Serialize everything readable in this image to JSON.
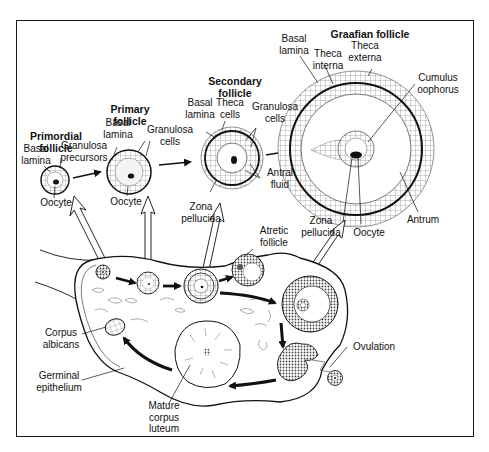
{
  "titles": {
    "primordial": "Primordial\nfollicle",
    "primary": "Primary\nfollicle",
    "secondary": "Secondary\nfollicle",
    "graafian": "Graafian follicle"
  },
  "labels": {
    "primordial_basal_lamina": "Basal\nlamina",
    "granulosa_precursors": "Granulosa\nprecursors",
    "primordial_oocyte": "Oocyte",
    "primary_basal_lamina": "Basal\nlamina",
    "primary_granulosa_cells": "Granulosa\ncells",
    "primary_oocyte": "Oocyte",
    "secondary_basal_lamina": "Basal\nlamina",
    "secondary_theca_cells": "Theca\ncells",
    "secondary_granulosa_cells": "Granulosa\ncells",
    "secondary_antral_fluid": "Antral\nfluid",
    "secondary_zona_pellucida": "Zona\npellucida",
    "graafian_basal_lamina": "Basal\nlamina",
    "graafian_theca_interna": "Theca\ninterna",
    "graafian_theca_externa": "Theca\nexterna",
    "graafian_cumulus_oophorus": "Cumulus\noophorus",
    "graafian_antrum": "Antrum",
    "graafian_zona_pellucida": "Zona\npellucida",
    "graafian_oocyte": "Oocyte",
    "atretic_follicle": "Atretic\nfollicle",
    "ovulation": "Ovulation",
    "corpus_albicans": "Corpus\nalbicans",
    "germinal_epithelium": "Germinal\nepithelium",
    "mature_corpus_luteum": "Mature\ncorpus\nluteum"
  },
  "colors": {
    "ink": "#111111",
    "background": "#ffffff",
    "stipple": "#555555"
  }
}
